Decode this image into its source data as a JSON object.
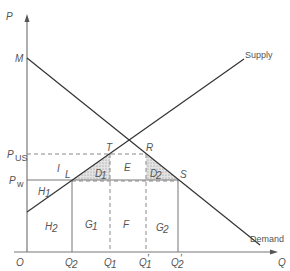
{
  "diagram": {
    "type": "supply-demand-tariff-quota",
    "axes": {
      "y_label": "P",
      "x_label": "Q",
      "origin_label": "O"
    },
    "price_labels": {
      "M": "M",
      "P_us_main": "P",
      "P_us_sub": "US",
      "P_w_main": "P",
      "P_w_sub": "w"
    },
    "curves": {
      "supply_label": "Supply",
      "demand_label": "Demand"
    },
    "points": {
      "L": "L",
      "T": "T",
      "R": "R",
      "S": "S"
    },
    "areas": {
      "I": "I",
      "D1": "D",
      "D1_sub": "1",
      "E": "E",
      "D2": "D",
      "D2_sub": "2",
      "H1": "H",
      "H1_sub": "1",
      "H2": "H",
      "H2_sub": "2",
      "G1": "G",
      "G1_sub": "1",
      "F": "F",
      "G2": "G",
      "G2_sub": "2"
    },
    "quantity_labels": {
      "Q2": "Q",
      "Q2_sub": "2",
      "Q1": "Q",
      "Q1_sub": "1",
      "Q1p": "Q",
      "Q1p_sub": "1",
      "Q1p_prime": "′",
      "Q2p": "Q",
      "Q2p_sub": "2",
      "Q2p_prime": "′"
    },
    "colors": {
      "axis": "#777777",
      "curve": "#333333",
      "label": "#555555",
      "hatch": "#999999"
    }
  }
}
